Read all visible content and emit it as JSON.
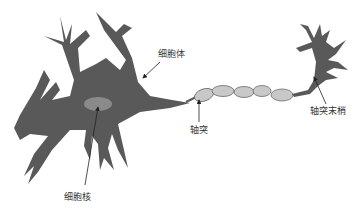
{
  "diagram": {
    "colors": {
      "cell_body": "#595959",
      "nucleus": "#8a8a8a",
      "myelin": "#c8c8c8",
      "myelin_stroke": "#6a6a6a",
      "arrow": "#222222",
      "background": "#ffffff"
    },
    "labels": {
      "cell_body": "细胞体",
      "nucleus": "细胞核",
      "axon": "轴突",
      "axon_terminal": "轴突末梢"
    }
  }
}
